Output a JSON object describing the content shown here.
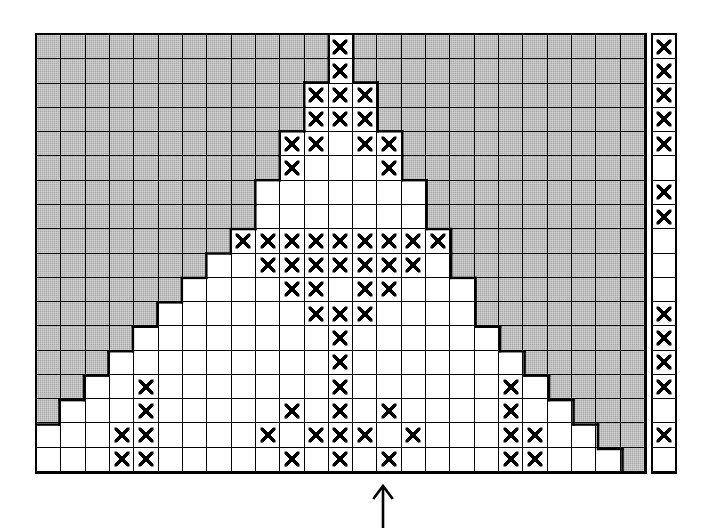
{
  "figure": {
    "title": "Counted cross-stitch style grid chart",
    "description": "Rectangular 25 x 18 grid of square cells. A triangular/mountain-shaped open (white) region rises from the lower edge toward the top centre; the surrounding background cells are shaded grey. Individual cells inside the open region are filled with an X symbol. A separate one-cell-wide column of cells stands at the far right, also carrying X symbols. A single upward arrow below the grid marks the centre column."
  },
  "grid": {
    "columns": 25,
    "rows": 18,
    "cell_symbol": "x-mark",
    "shaded_label": "shaded background cell",
    "open_label": "open working cell",
    "colors": {
      "shaded": "#a8a8a8",
      "open": "#ffffff",
      "line": "#000000",
      "mark": "#000000"
    },
    "shaded_rows": [
      [
        1,
        1,
        1,
        1,
        1,
        1,
        1,
        1,
        1,
        1,
        1,
        1,
        0,
        1,
        1,
        1,
        1,
        1,
        1,
        1,
        1,
        1,
        1,
        1,
        1
      ],
      [
        1,
        1,
        1,
        1,
        1,
        1,
        1,
        1,
        1,
        1,
        1,
        1,
        0,
        1,
        1,
        1,
        1,
        1,
        1,
        1,
        1,
        1,
        1,
        1,
        1
      ],
      [
        1,
        1,
        1,
        1,
        1,
        1,
        1,
        1,
        1,
        1,
        1,
        0,
        0,
        0,
        1,
        1,
        1,
        1,
        1,
        1,
        1,
        1,
        1,
        1,
        1
      ],
      [
        1,
        1,
        1,
        1,
        1,
        1,
        1,
        1,
        1,
        1,
        1,
        0,
        0,
        0,
        1,
        1,
        1,
        1,
        1,
        1,
        1,
        1,
        1,
        1,
        1
      ],
      [
        1,
        1,
        1,
        1,
        1,
        1,
        1,
        1,
        1,
        1,
        0,
        0,
        0,
        0,
        0,
        1,
        1,
        1,
        1,
        1,
        1,
        1,
        1,
        1,
        1
      ],
      [
        1,
        1,
        1,
        1,
        1,
        1,
        1,
        1,
        1,
        1,
        0,
        0,
        0,
        0,
        0,
        1,
        1,
        1,
        1,
        1,
        1,
        1,
        1,
        1,
        1
      ],
      [
        1,
        1,
        1,
        1,
        1,
        1,
        1,
        1,
        1,
        0,
        0,
        0,
        0,
        0,
        0,
        0,
        1,
        1,
        1,
        1,
        1,
        1,
        1,
        1,
        1
      ],
      [
        1,
        1,
        1,
        1,
        1,
        1,
        1,
        1,
        1,
        0,
        0,
        0,
        0,
        0,
        0,
        0,
        1,
        1,
        1,
        1,
        1,
        1,
        1,
        1,
        1
      ],
      [
        1,
        1,
        1,
        1,
        1,
        1,
        1,
        1,
        0,
        0,
        0,
        0,
        0,
        0,
        0,
        0,
        0,
        1,
        1,
        1,
        1,
        1,
        1,
        1,
        1
      ],
      [
        1,
        1,
        1,
        1,
        1,
        1,
        1,
        0,
        0,
        0,
        0,
        0,
        0,
        0,
        0,
        0,
        0,
        1,
        1,
        1,
        1,
        1,
        1,
        1,
        1
      ],
      [
        1,
        1,
        1,
        1,
        1,
        1,
        0,
        0,
        0,
        0,
        0,
        0,
        0,
        0,
        0,
        0,
        0,
        0,
        1,
        1,
        1,
        1,
        1,
        1,
        1
      ],
      [
        1,
        1,
        1,
        1,
        1,
        0,
        0,
        0,
        0,
        0,
        0,
        0,
        0,
        0,
        0,
        0,
        0,
        0,
        1,
        1,
        1,
        1,
        1,
        1,
        1
      ],
      [
        1,
        1,
        1,
        1,
        0,
        0,
        0,
        0,
        0,
        0,
        0,
        0,
        0,
        0,
        0,
        0,
        0,
        0,
        0,
        1,
        1,
        1,
        1,
        1,
        1
      ],
      [
        1,
        1,
        1,
        0,
        0,
        0,
        0,
        0,
        0,
        0,
        0,
        0,
        0,
        0,
        0,
        0,
        0,
        0,
        0,
        0,
        1,
        1,
        1,
        1,
        1
      ],
      [
        1,
        1,
        0,
        0,
        0,
        0,
        0,
        0,
        0,
        0,
        0,
        0,
        0,
        0,
        0,
        0,
        0,
        0,
        0,
        0,
        0,
        1,
        1,
        1,
        1
      ],
      [
        1,
        0,
        0,
        0,
        0,
        0,
        0,
        0,
        0,
        0,
        0,
        0,
        0,
        0,
        0,
        0,
        0,
        0,
        0,
        0,
        0,
        0,
        1,
        1,
        1
      ],
      [
        0,
        0,
        0,
        0,
        0,
        0,
        0,
        0,
        0,
        0,
        0,
        0,
        0,
        0,
        0,
        0,
        0,
        0,
        0,
        0,
        0,
        0,
        0,
        1,
        1
      ],
      [
        0,
        0,
        0,
        0,
        0,
        0,
        0,
        0,
        0,
        0,
        0,
        0,
        0,
        0,
        0,
        0,
        0,
        0,
        0,
        0,
        0,
        0,
        0,
        0,
        1
      ]
    ],
    "mark_rows": [
      [
        0,
        0,
        0,
        0,
        0,
        0,
        0,
        0,
        0,
        0,
        0,
        0,
        1,
        0,
        0,
        0,
        0,
        0,
        0,
        0,
        0,
        0,
        0,
        0,
        0
      ],
      [
        0,
        0,
        0,
        0,
        0,
        0,
        0,
        0,
        0,
        0,
        0,
        0,
        1,
        0,
        0,
        0,
        0,
        0,
        0,
        0,
        0,
        0,
        0,
        0,
        0
      ],
      [
        0,
        0,
        0,
        0,
        0,
        0,
        0,
        0,
        0,
        0,
        0,
        1,
        1,
        1,
        0,
        0,
        0,
        0,
        0,
        0,
        0,
        0,
        0,
        0,
        0
      ],
      [
        0,
        0,
        0,
        0,
        0,
        0,
        0,
        0,
        0,
        0,
        0,
        1,
        1,
        1,
        0,
        0,
        0,
        0,
        0,
        0,
        0,
        0,
        0,
        0,
        0
      ],
      [
        0,
        0,
        0,
        0,
        0,
        0,
        0,
        0,
        0,
        0,
        1,
        1,
        0,
        1,
        1,
        0,
        0,
        0,
        0,
        0,
        0,
        0,
        0,
        0,
        0
      ],
      [
        0,
        0,
        0,
        0,
        0,
        0,
        0,
        0,
        0,
        0,
        1,
        0,
        0,
        0,
        1,
        0,
        0,
        0,
        0,
        0,
        0,
        0,
        0,
        0,
        0
      ],
      [
        0,
        0,
        0,
        0,
        0,
        0,
        0,
        0,
        0,
        0,
        0,
        0,
        0,
        0,
        0,
        0,
        0,
        0,
        0,
        0,
        0,
        0,
        0,
        0,
        0
      ],
      [
        0,
        0,
        0,
        0,
        0,
        0,
        0,
        0,
        0,
        0,
        0,
        0,
        0,
        0,
        0,
        0,
        0,
        0,
        0,
        0,
        0,
        0,
        0,
        0,
        0
      ],
      [
        0,
        0,
        0,
        0,
        0,
        0,
        0,
        0,
        1,
        1,
        1,
        1,
        1,
        1,
        1,
        1,
        1,
        0,
        0,
        0,
        0,
        0,
        0,
        0,
        0
      ],
      [
        0,
        0,
        0,
        0,
        0,
        0,
        0,
        0,
        0,
        1,
        1,
        1,
        1,
        1,
        1,
        1,
        0,
        0,
        0,
        0,
        0,
        0,
        0,
        0,
        0
      ],
      [
        0,
        0,
        0,
        0,
        0,
        0,
        0,
        0,
        0,
        0,
        1,
        1,
        0,
        1,
        1,
        0,
        0,
        0,
        0,
        0,
        0,
        0,
        0,
        0,
        0
      ],
      [
        0,
        0,
        0,
        0,
        0,
        0,
        0,
        0,
        0,
        0,
        0,
        1,
        1,
        1,
        0,
        0,
        0,
        0,
        0,
        0,
        0,
        0,
        0,
        0,
        0
      ],
      [
        0,
        0,
        0,
        0,
        0,
        0,
        0,
        0,
        0,
        0,
        0,
        0,
        1,
        0,
        0,
        0,
        0,
        0,
        0,
        0,
        0,
        0,
        0,
        0,
        0
      ],
      [
        0,
        0,
        0,
        0,
        0,
        0,
        0,
        0,
        0,
        0,
        0,
        0,
        1,
        0,
        0,
        0,
        0,
        0,
        0,
        0,
        0,
        0,
        0,
        0,
        0
      ],
      [
        0,
        0,
        0,
        0,
        1,
        0,
        0,
        0,
        0,
        0,
        0,
        0,
        1,
        0,
        0,
        0,
        0,
        0,
        0,
        1,
        0,
        0,
        0,
        0,
        0
      ],
      [
        0,
        0,
        0,
        0,
        1,
        0,
        0,
        0,
        0,
        0,
        1,
        0,
        1,
        0,
        1,
        0,
        0,
        0,
        0,
        1,
        0,
        0,
        0,
        0,
        0
      ],
      [
        0,
        0,
        0,
        1,
        1,
        0,
        0,
        0,
        0,
        1,
        0,
        1,
        1,
        1,
        0,
        1,
        0,
        0,
        0,
        1,
        1,
        0,
        0,
        0,
        0
      ],
      [
        0,
        0,
        0,
        1,
        1,
        0,
        0,
        0,
        0,
        0,
        1,
        0,
        1,
        0,
        1,
        0,
        0,
        0,
        0,
        1,
        1,
        0,
        0,
        0,
        0
      ]
    ],
    "mark_rows_lower": [
      [
        0,
        0,
        1,
        1,
        1,
        0,
        0,
        0,
        0,
        1,
        0,
        1,
        0,
        1,
        0,
        1,
        0,
        0,
        0,
        1,
        1,
        1,
        0,
        0,
        0
      ],
      [
        0,
        0,
        1,
        1,
        0,
        0,
        0,
        1,
        0,
        1,
        0,
        0,
        0,
        1,
        0,
        0,
        1,
        0,
        0,
        0,
        1,
        1,
        0,
        0,
        0
      ],
      [
        0,
        1,
        1,
        0,
        0,
        0,
        0,
        0,
        1,
        0,
        0,
        0,
        0,
        0,
        0,
        1,
        0,
        0,
        0,
        0,
        0,
        1,
        1,
        0,
        0
      ],
      [
        0,
        1,
        0,
        0,
        0,
        0,
        1,
        0,
        0,
        0,
        0,
        0,
        0,
        0,
        0,
        0,
        1,
        0,
        0,
        0,
        0,
        0,
        1,
        0,
        0
      ]
    ]
  },
  "key_column": {
    "label": "right-hand single-cell key column",
    "rows": 18,
    "marks": [
      1,
      1,
      1,
      1,
      1,
      0,
      1,
      1,
      0,
      0,
      0,
      1,
      1,
      1,
      1,
      0,
      1,
      0
    ]
  },
  "arrow": {
    "name": "centre-column-pointer",
    "direction": "up",
    "glyph": "↑"
  }
}
